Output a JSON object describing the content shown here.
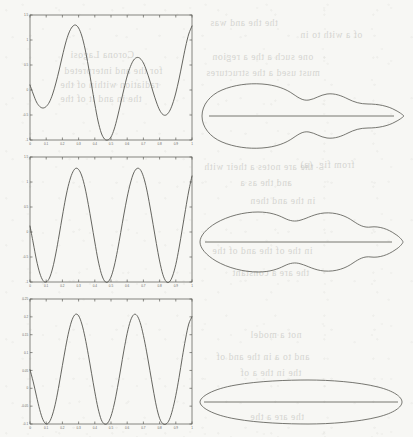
{
  "figure": {
    "caption": "",
    "background_color": "#f7f7f4",
    "ink_color": "#54544e",
    "panel_count": 3
  },
  "ghost_text": [
    {
      "text": "the the and was",
      "x": 210,
      "y": 18
    },
    {
      "text": "of a with to in",
      "x": 300,
      "y": 30
    },
    {
      "text": "Corona   Lagosi",
      "x": 70,
      "y": 50
    },
    {
      "text": "one such a the a region",
      "x": 212,
      "y": 52
    },
    {
      "text": "must used a the structures",
      "x": 206,
      "y": 68
    },
    {
      "text": "for the and interpreted",
      "x": 64,
      "y": 66
    },
    {
      "text": "radiation within of the",
      "x": 60,
      "y": 80
    },
    {
      "text": "the in and it of the",
      "x": 60,
      "y": 94
    },
    {
      "text": "from fig. (a)",
      "x": 300,
      "y": 160
    },
    {
      "text": "the are notes a their with",
      "x": 204,
      "y": 162
    },
    {
      "text": "and the as a",
      "x": 240,
      "y": 178
    },
    {
      "text": "in the and then",
      "x": 250,
      "y": 196
    },
    {
      "text": "in the of the and of the",
      "x": 212,
      "y": 246
    },
    {
      "text": "the are a constant",
      "x": 232,
      "y": 268
    },
    {
      "text": "not a model",
      "x": 250,
      "y": 330
    },
    {
      "text": "and to a in the and of",
      "x": 216,
      "y": 352
    },
    {
      "text": "the in the a of",
      "x": 240,
      "y": 368
    },
    {
      "text": "the are a the",
      "x": 250,
      "y": 412
    }
  ],
  "chart_data": [
    {
      "id": "panel-1-waveform",
      "type": "line",
      "title": "",
      "xlabel": "",
      "ylabel": "",
      "xlim": [
        0,
        1
      ],
      "ylim": [
        -1.0,
        1.5
      ],
      "grid": false,
      "legend": "none",
      "xticks": [
        0,
        0.1,
        0.2,
        0.3,
        0.4,
        0.5,
        0.6,
        0.7,
        0.8,
        0.9,
        1
      ],
      "xticklabels": [
        "0",
        "0.1",
        "0.2",
        "0.3",
        "0.4",
        "0.5",
        "0.6",
        "0.7",
        "0.8",
        "0.9",
        "1"
      ],
      "yticks": [
        -1.0,
        -0.5,
        0,
        0.5,
        1.0,
        1.5
      ],
      "yticklabels": [
        "-1",
        "-0.5",
        "0",
        "0.5",
        "1",
        "1.5"
      ],
      "series": [
        {
          "name": "signal",
          "x": [
            0.0,
            0.02,
            0.04,
            0.06,
            0.08,
            0.1,
            0.12,
            0.14,
            0.16,
            0.18,
            0.2,
            0.22,
            0.24,
            0.26,
            0.28,
            0.3,
            0.32,
            0.34,
            0.36,
            0.38,
            0.4,
            0.42,
            0.44,
            0.46,
            0.48,
            0.5,
            0.52,
            0.54,
            0.56,
            0.58,
            0.6,
            0.62,
            0.64,
            0.66,
            0.68,
            0.7,
            0.72,
            0.74,
            0.76,
            0.78,
            0.8,
            0.82,
            0.84,
            0.86,
            0.88,
            0.9,
            0.92,
            0.94,
            0.96,
            0.98,
            1.0
          ],
          "y": [
            0.1,
            -0.08,
            -0.24,
            -0.33,
            -0.36,
            -0.33,
            -0.24,
            -0.08,
            0.14,
            0.4,
            0.68,
            0.94,
            1.14,
            1.26,
            1.3,
            1.24,
            1.08,
            0.82,
            0.48,
            0.1,
            -0.28,
            -0.62,
            -0.86,
            -0.98,
            -1.0,
            -0.94,
            -0.78,
            -0.54,
            -0.26,
            0.02,
            0.28,
            0.47,
            0.6,
            0.65,
            0.63,
            0.54,
            0.38,
            0.18,
            -0.04,
            -0.24,
            -0.4,
            -0.49,
            -0.5,
            -0.43,
            -0.28,
            -0.06,
            0.22,
            0.54,
            0.86,
            1.12,
            1.28
          ]
        }
      ]
    },
    {
      "id": "panel-2-waveform",
      "type": "line",
      "title": "",
      "xlabel": "",
      "ylabel": "",
      "xlim": [
        0,
        1
      ],
      "ylim": [
        -1.0,
        1.5
      ],
      "grid": false,
      "legend": "none",
      "xticks": [
        0,
        0.1,
        0.2,
        0.3,
        0.4,
        0.5,
        0.6,
        0.7,
        0.8,
        0.9,
        1
      ],
      "xticklabels": [
        "0",
        "0.1",
        "0.2",
        "0.3",
        "0.4",
        "0.5",
        "0.6",
        "0.7",
        "0.8",
        "0.9",
        "1"
      ],
      "yticks": [
        -1.0,
        -0.5,
        0,
        0.5,
        1.0,
        1.5
      ],
      "yticklabels": [
        "-1",
        "-0.5",
        "0",
        "0.5",
        "1",
        "1.5"
      ],
      "series": [
        {
          "name": "signal",
          "x": [
            0.0,
            0.02,
            0.04,
            0.06,
            0.08,
            0.1,
            0.12,
            0.14,
            0.16,
            0.18,
            0.2,
            0.22,
            0.24,
            0.26,
            0.28,
            0.3,
            0.32,
            0.34,
            0.36,
            0.38,
            0.4,
            0.42,
            0.44,
            0.46,
            0.48,
            0.5,
            0.52,
            0.54,
            0.56,
            0.58,
            0.6,
            0.62,
            0.64,
            0.66,
            0.68,
            0.7,
            0.72,
            0.74,
            0.76,
            0.78,
            0.8,
            0.82,
            0.84,
            0.86,
            0.88,
            0.9,
            0.92,
            0.94,
            0.96,
            0.98,
            1.0
          ],
          "y": [
            0.12,
            -0.22,
            -0.56,
            -0.82,
            -0.97,
            -1.0,
            -0.92,
            -0.72,
            -0.42,
            -0.06,
            0.32,
            0.68,
            0.97,
            1.17,
            1.27,
            1.25,
            1.12,
            0.88,
            0.55,
            0.18,
            -0.2,
            -0.56,
            -0.83,
            -0.98,
            -1.0,
            -0.9,
            -0.68,
            -0.37,
            -0.01,
            0.36,
            0.7,
            0.98,
            1.18,
            1.27,
            1.25,
            1.11,
            0.86,
            0.52,
            0.15,
            -0.23,
            -0.58,
            -0.85,
            -0.99,
            -1.0,
            -0.88,
            -0.65,
            -0.32,
            0.06,
            0.45,
            0.82,
            1.12
          ]
        }
      ]
    },
    {
      "id": "panel-3-waveform",
      "type": "line",
      "title": "",
      "xlabel": "",
      "ylabel": "",
      "xlim": [
        0,
        1
      ],
      "ylim": [
        -0.1,
        0.25
      ],
      "grid": false,
      "legend": "none",
      "xticks": [
        0,
        0.1,
        0.2,
        0.3,
        0.4,
        0.5,
        0.6,
        0.7,
        0.8,
        0.9,
        1
      ],
      "xticklabels": [
        "0",
        "0.1",
        "0.2",
        "0.3",
        "0.4",
        "0.5",
        "0.6",
        "0.7",
        "0.8",
        "0.9",
        "1"
      ],
      "yticks": [
        -0.1,
        -0.05,
        0,
        0.05,
        0.1,
        0.15,
        0.2,
        0.25
      ],
      "yticklabels": [
        "-0.1",
        "-0.05",
        "0",
        "0.05",
        "0.1",
        "0.15",
        "0.2",
        "0.25"
      ],
      "series": [
        {
          "name": "signal",
          "x": [
            0.0,
            0.02,
            0.04,
            0.06,
            0.08,
            0.1,
            0.12,
            0.14,
            0.16,
            0.18,
            0.2,
            0.22,
            0.24,
            0.26,
            0.28,
            0.3,
            0.32,
            0.34,
            0.36,
            0.38,
            0.4,
            0.42,
            0.44,
            0.46,
            0.48,
            0.5,
            0.52,
            0.54,
            0.56,
            0.58,
            0.6,
            0.62,
            0.64,
            0.66,
            0.68,
            0.7,
            0.72,
            0.74,
            0.76,
            0.78,
            0.8,
            0.82,
            0.84,
            0.86,
            0.88,
            0.9,
            0.92,
            0.94,
            0.96,
            0.98,
            1.0
          ],
          "y": [
            0.052,
            0.018,
            -0.022,
            -0.06,
            -0.088,
            -0.1,
            -0.094,
            -0.072,
            -0.036,
            0.012,
            0.064,
            0.115,
            0.16,
            0.192,
            0.207,
            0.203,
            0.18,
            0.142,
            0.094,
            0.042,
            -0.01,
            -0.056,
            -0.088,
            -0.1,
            -0.097,
            -0.078,
            -0.044,
            0.002,
            0.054,
            0.107,
            0.154,
            0.189,
            0.206,
            0.204,
            0.184,
            0.148,
            0.102,
            0.05,
            -0.002,
            -0.05,
            -0.084,
            -0.099,
            -0.1,
            -0.088,
            -0.06,
            -0.02,
            0.03,
            0.086,
            0.138,
            0.18,
            0.2
          ]
        }
      ]
    }
  ],
  "polar_shapes": [
    {
      "id": "shape-1-pattern",
      "type": "polar",
      "description": "asymmetric multi-lobed closed contour with horizontal chord",
      "symmetric": false,
      "lobes": 3,
      "chord_label": ""
    },
    {
      "id": "shape-2-pattern",
      "type": "polar",
      "description": "symmetric three-lobed closed contour with horizontal chord",
      "symmetric": true,
      "lobes": 3,
      "chord_label": ""
    },
    {
      "id": "shape-3-pattern",
      "type": "polar",
      "description": "narrow symmetric lens-shaped closed contour with horizontal chord",
      "symmetric": true,
      "lobes": 1,
      "chord_label": ""
    }
  ]
}
